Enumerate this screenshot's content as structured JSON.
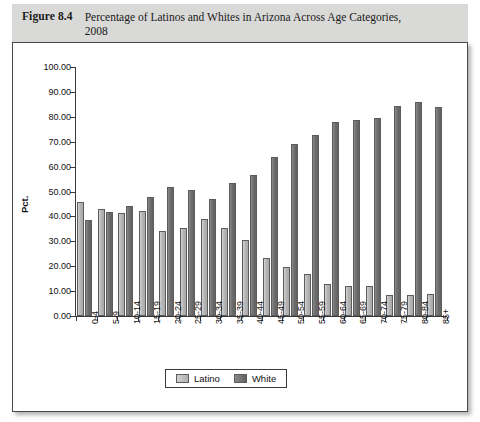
{
  "caption": {
    "label": "Figure 8.4",
    "text": "Percentage of Latinos and Whites in Arizona Across Age Categories, 2008"
  },
  "legend": {
    "position": "bottom-center",
    "items": [
      {
        "name": "Latino",
        "color": "#b5b5b5"
      },
      {
        "name": "White",
        "color": "#6d6d6d"
      }
    ]
  },
  "chart_data": {
    "type": "bar",
    "title": "Percentage of Latinos and Whites in Arizona Across Age Categories, 2008",
    "xlabel": "",
    "ylabel": "Pct.",
    "ylim": [
      0,
      100
    ],
    "ytick_labels": [
      "0.00",
      "10.00",
      "20.00",
      "30.00",
      "40.00",
      "50.00",
      "60.00",
      "70.00",
      "80.00",
      "90.00",
      "100.00"
    ],
    "ytick_values": [
      0,
      10,
      20,
      30,
      40,
      50,
      60,
      70,
      80,
      90,
      100
    ],
    "grid": false,
    "categories": [
      "0-4",
      "5-9",
      "10-14",
      "15-19",
      "20-24",
      "25-29",
      "30-34",
      "35-39",
      "40-44",
      "45-49",
      "50-54",
      "55-59",
      "60-64",
      "65-69",
      "70-74",
      "75-79",
      "80-84",
      "85+"
    ],
    "series": [
      {
        "name": "Latino",
        "color": "#b5b5b5",
        "values": [
          45.8,
          42.8,
          41.2,
          42.0,
          34.0,
          35.4,
          38.8,
          35.2,
          30.6,
          23.5,
          19.6,
          16.8,
          13.0,
          12.0,
          12.0,
          8.4,
          8.3,
          9.0
        ]
      },
      {
        "name": "White",
        "color": "#6d6d6d",
        "values": [
          38.6,
          41.6,
          44.0,
          47.6,
          51.8,
          50.6,
          47.0,
          53.6,
          56.8,
          64.0,
          69.2,
          72.8,
          77.8,
          78.6,
          79.6,
          84.2,
          86.0,
          83.8
        ]
      }
    ]
  }
}
